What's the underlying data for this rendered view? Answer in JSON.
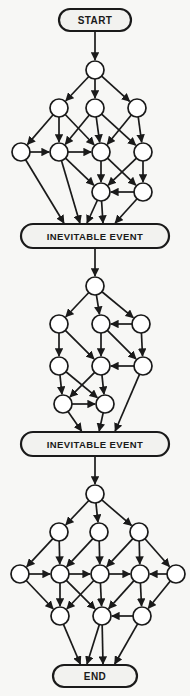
{
  "diagram": {
    "title_terminals": {
      "start": "START",
      "event1": "INEVITABLE EVENT",
      "event2": "INEVITABLE EVENT",
      "end": "END"
    },
    "colors": {
      "background": "#f7f7f5",
      "stroke": "#1a1a1a",
      "node_fill": "#ffffff",
      "terminal_fill": "#f2f2ef",
      "text": "#1a1a1a"
    },
    "style": {
      "node_radius": 9,
      "stroke_width": 1.7,
      "terminal_stroke_width": 2.2,
      "terminal_corner_radius": 12
    },
    "terminals": [
      {
        "id": "start",
        "label": "START",
        "x": 95,
        "y": 20,
        "w": 72,
        "h": 22,
        "font_size": 10
      },
      {
        "id": "event1",
        "label": "INEVITABLE EVENT",
        "x": 95,
        "y": 236,
        "w": 148,
        "h": 24,
        "font_size": 9.5
      },
      {
        "id": "event2",
        "label": "INEVITABLE EVENT",
        "x": 95,
        "y": 444,
        "w": 148,
        "h": 24,
        "font_size": 9.5
      },
      {
        "id": "end",
        "label": "END",
        "x": 95,
        "y": 676,
        "w": 84,
        "h": 22,
        "font_size": 10
      }
    ],
    "nodes": [
      {
        "id": "n1",
        "x": 95,
        "y": 70
      },
      {
        "id": "n2",
        "x": 59,
        "y": 108
      },
      {
        "id": "n3",
        "x": 95,
        "y": 108
      },
      {
        "id": "n4",
        "x": 137,
        "y": 108
      },
      {
        "id": "n5",
        "x": 21,
        "y": 152
      },
      {
        "id": "n6",
        "x": 59,
        "y": 152
      },
      {
        "id": "n7",
        "x": 101,
        "y": 152
      },
      {
        "id": "n8",
        "x": 143,
        "y": 152
      },
      {
        "id": "n9",
        "x": 101,
        "y": 192
      },
      {
        "id": "n10",
        "x": 143,
        "y": 192
      },
      {
        "id": "m1",
        "x": 95,
        "y": 286
      },
      {
        "id": "m2",
        "x": 59,
        "y": 324
      },
      {
        "id": "m3",
        "x": 101,
        "y": 324
      },
      {
        "id": "m4",
        "x": 141,
        "y": 324
      },
      {
        "id": "m5",
        "x": 59,
        "y": 366
      },
      {
        "id": "m6",
        "x": 101,
        "y": 366
      },
      {
        "id": "m7",
        "x": 143,
        "y": 366
      },
      {
        "id": "m8",
        "x": 63,
        "y": 404
      },
      {
        "id": "m9",
        "x": 105,
        "y": 404
      },
      {
        "id": "b1",
        "x": 95,
        "y": 494
      },
      {
        "id": "b2",
        "x": 59,
        "y": 532
      },
      {
        "id": "b3",
        "x": 99,
        "y": 532
      },
      {
        "id": "b4",
        "x": 139,
        "y": 532
      },
      {
        "id": "b5",
        "x": 20,
        "y": 574
      },
      {
        "id": "b6",
        "x": 60,
        "y": 574
      },
      {
        "id": "b7",
        "x": 100,
        "y": 574
      },
      {
        "id": "b8",
        "x": 140,
        "y": 574
      },
      {
        "id": "b9",
        "x": 176,
        "y": 574
      },
      {
        "id": "b10",
        "x": 60,
        "y": 616
      },
      {
        "id": "b11",
        "x": 102,
        "y": 616
      },
      {
        "id": "b12",
        "x": 142,
        "y": 616
      }
    ],
    "edges": [
      {
        "from": "start",
        "to": "n1",
        "kind": "terminal-node"
      },
      {
        "from": "n1",
        "to": "n2"
      },
      {
        "from": "n1",
        "to": "n3"
      },
      {
        "from": "n1",
        "to": "n4"
      },
      {
        "from": "n2",
        "to": "n5"
      },
      {
        "from": "n2",
        "to": "n6"
      },
      {
        "from": "n2",
        "to": "n7"
      },
      {
        "from": "n3",
        "to": "n6"
      },
      {
        "from": "n3",
        "to": "n7"
      },
      {
        "from": "n3",
        "to": "n8"
      },
      {
        "from": "n4",
        "to": "n7"
      },
      {
        "from": "n4",
        "to": "n8"
      },
      {
        "from": "n5",
        "to": "n6"
      },
      {
        "from": "n6",
        "to": "n7"
      },
      {
        "from": "n6",
        "to": "n9"
      },
      {
        "from": "n7",
        "to": "n9"
      },
      {
        "from": "n7",
        "to": "n10"
      },
      {
        "from": "n8",
        "to": "n9"
      },
      {
        "from": "n8",
        "to": "n10"
      },
      {
        "from": "n10",
        "to": "n9"
      },
      {
        "from": "n5",
        "to": "event1",
        "kind": "node-terminal"
      },
      {
        "from": "n6",
        "to": "event1",
        "kind": "node-terminal"
      },
      {
        "from": "n9",
        "to": "event1",
        "kind": "node-terminal"
      },
      {
        "from": "n9",
        "to": "event1",
        "kind": "node-terminal"
      },
      {
        "from": "n10",
        "to": "event1",
        "kind": "node-terminal"
      },
      {
        "from": "event1",
        "to": "m1",
        "kind": "terminal-node"
      },
      {
        "from": "m1",
        "to": "m2"
      },
      {
        "from": "m1",
        "to": "m3"
      },
      {
        "from": "m1",
        "to": "m4"
      },
      {
        "from": "m4",
        "to": "m3"
      },
      {
        "from": "m2",
        "to": "m5"
      },
      {
        "from": "m2",
        "to": "m6"
      },
      {
        "from": "m3",
        "to": "m6"
      },
      {
        "from": "m3",
        "to": "m7"
      },
      {
        "from": "m4",
        "to": "m7"
      },
      {
        "from": "m7",
        "to": "m6"
      },
      {
        "from": "m5",
        "to": "m8"
      },
      {
        "from": "m5",
        "to": "m9"
      },
      {
        "from": "m6",
        "to": "m8"
      },
      {
        "from": "m6",
        "to": "m9"
      },
      {
        "from": "m8",
        "to": "m9"
      },
      {
        "from": "m8",
        "to": "event2",
        "kind": "node-terminal"
      },
      {
        "from": "m9",
        "to": "event2",
        "kind": "node-terminal"
      },
      {
        "from": "m7",
        "to": "event2",
        "kind": "node-terminal"
      },
      {
        "from": "event2",
        "to": "b1",
        "kind": "terminal-node"
      },
      {
        "from": "b1",
        "to": "b2"
      },
      {
        "from": "b1",
        "to": "b3"
      },
      {
        "from": "b1",
        "to": "b4"
      },
      {
        "from": "b2",
        "to": "b5"
      },
      {
        "from": "b2",
        "to": "b6"
      },
      {
        "from": "b3",
        "to": "b6"
      },
      {
        "from": "b3",
        "to": "b7"
      },
      {
        "from": "b4",
        "to": "b7"
      },
      {
        "from": "b4",
        "to": "b8"
      },
      {
        "from": "b4",
        "to": "b9"
      },
      {
        "from": "b5",
        "to": "b6"
      },
      {
        "from": "b6",
        "to": "b7"
      },
      {
        "from": "b7",
        "to": "b8"
      },
      {
        "from": "b9",
        "to": "b8"
      },
      {
        "from": "b5",
        "to": "b10"
      },
      {
        "from": "b6",
        "to": "b10"
      },
      {
        "from": "b6",
        "to": "b11"
      },
      {
        "from": "b7",
        "to": "b10"
      },
      {
        "from": "b7",
        "to": "b11"
      },
      {
        "from": "b8",
        "to": "b11"
      },
      {
        "from": "b8",
        "to": "b12"
      },
      {
        "from": "b9",
        "to": "b12"
      },
      {
        "from": "b12",
        "to": "b11"
      },
      {
        "from": "b10",
        "to": "end",
        "kind": "node-terminal"
      },
      {
        "from": "b11",
        "to": "end",
        "kind": "node-terminal"
      },
      {
        "from": "b11",
        "to": "end",
        "kind": "node-terminal"
      },
      {
        "from": "b12",
        "to": "end",
        "kind": "node-terminal"
      }
    ]
  }
}
